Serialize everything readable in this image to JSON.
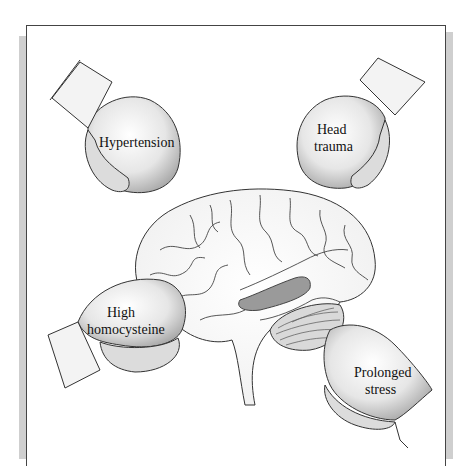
{
  "figure": {
    "caption_labels": {
      "top_left": "Hypertension",
      "top_right_line1": "Head",
      "top_right_line2": "trauma",
      "bottom_left_line1": "High",
      "bottom_left_line2": "homocysteine",
      "bottom_right_line1": "Prolonged",
      "bottom_right_line2": "stress"
    },
    "gloves": [
      {
        "id": "hypertension",
        "label": "Hypertension",
        "position": "top-left"
      },
      {
        "id": "head-trauma",
        "label": "Head trauma",
        "position": "top-right"
      },
      {
        "id": "high-homocysteine",
        "label": "High homocysteine",
        "position": "bottom-left"
      },
      {
        "id": "prolonged-stress",
        "label": "Prolonged stress",
        "position": "bottom-right"
      }
    ],
    "colors": {
      "line": "#333333",
      "glove_fill": "#e8e8e8",
      "glove_shade": "#bdbdbd",
      "highlight_region": "#9a9a9a",
      "frame_shadow": "#cfcfcf"
    }
  }
}
